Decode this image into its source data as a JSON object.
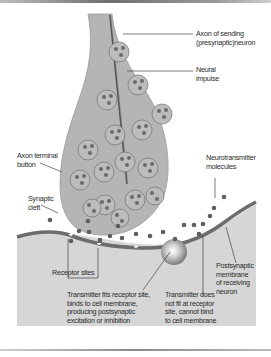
{
  "figure": {
    "colors": {
      "presynaptic_fill": "#b5b5b5",
      "postsynaptic_fill": "#d6d6d6",
      "membrane": "#6c6c6c",
      "vesicle_fill": "#bcbcbc",
      "molecule": "#5f5f5f",
      "cleft": "#ffffff"
    },
    "labels": {
      "axon": "Axon of sending\n(presynaptic)neuron",
      "impulse": "Neural\nimpulse",
      "terminal": "Axon terminal\nbutton",
      "neurotransmitter": "Neurotransmitter\nmolecules",
      "cleft": "Synaptic\ncleft",
      "postsynaptic": "Postsynaptic\nmembrane\nof receiving\nneuron",
      "receptor_sites": "Receptor sites",
      "fits": "Transmitter fits receptor site,\nbinds to cell membrane,\nproducing postsynaptic\nexcitation or inhibition",
      "not_fit": "Transmitter does\nnot fit at receptor\nsite, cannot bind\nto cell membrane"
    }
  }
}
